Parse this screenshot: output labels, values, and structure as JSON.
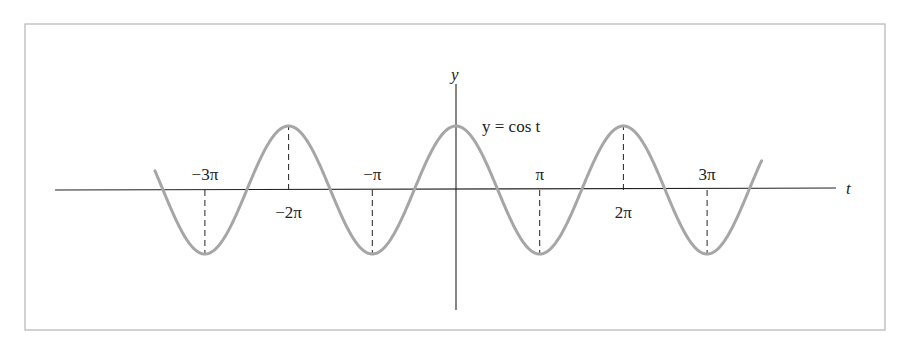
{
  "chart_data": {
    "type": "line",
    "title": "",
    "function_label": "y = cos t",
    "xlabel": "t",
    "ylabel": "y",
    "x_ticks": [
      {
        "label": "−3π",
        "value": -9.42478,
        "label_position": "above"
      },
      {
        "label": "−2π",
        "value": -6.28319,
        "label_position": "below"
      },
      {
        "label": "−π",
        "value": -3.14159,
        "label_position": "above"
      },
      {
        "label": "π",
        "value": 3.14159,
        "label_position": "above"
      },
      {
        "label": "2π",
        "value": 6.28319,
        "label_position": "below"
      },
      {
        "label": "3π",
        "value": 9.42478,
        "label_position": "above"
      }
    ],
    "series": [
      {
        "name": "y = cos t",
        "function": "cos",
        "x_range": [
          -11.3,
          11.47
        ],
        "color": "#a6a6a6"
      }
    ],
    "extrema_markers": [
      {
        "t": -9.42478,
        "y": -1
      },
      {
        "t": -6.28319,
        "y": 1
      },
      {
        "t": -3.14159,
        "y": -1
      },
      {
        "t": 3.14159,
        "y": -1
      },
      {
        "t": 6.28319,
        "y": 1
      },
      {
        "t": 9.42478,
        "y": -1
      }
    ],
    "ylim": [
      -1,
      1
    ],
    "grid": false,
    "legend": "none"
  },
  "colors": {
    "curve": "#a6a6a6",
    "axes": "#222222",
    "frame": "#b5b5b5"
  }
}
